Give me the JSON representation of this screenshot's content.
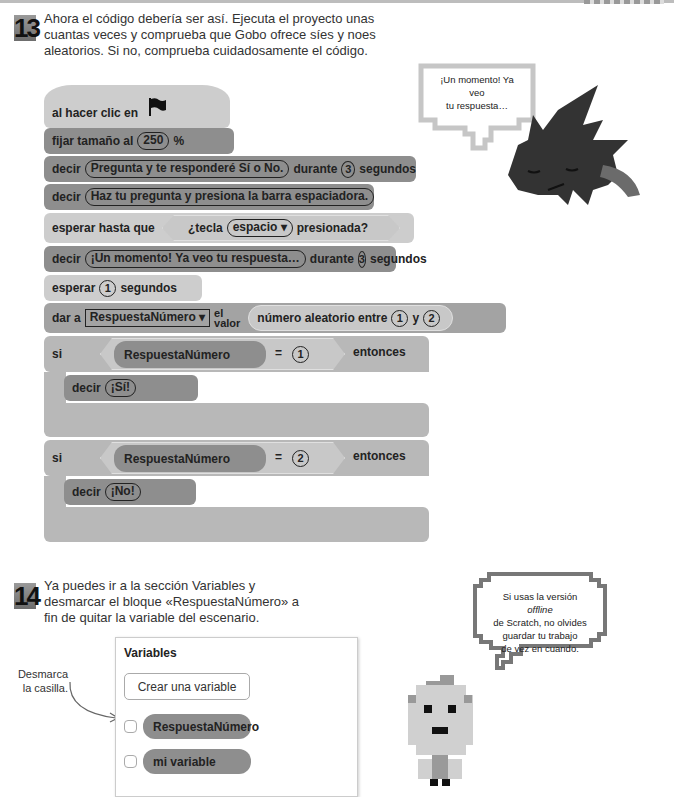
{
  "steps": [
    {
      "number": "13",
      "text": "Ahora el código debería ser así. Ejecuta el proyecto unas cuantas veces y comprueba que Gobo ofrece síes y noes aleatorios. Si no, comprueba cuidadosamente el código."
    },
    {
      "number": "14",
      "text": "Ya puedes ir a la sección Variables y desmarcar el bloque «RespuestaNúmero» a fin de quitar la variable del escenario."
    }
  ],
  "script": {
    "hat": {
      "label": "al hacer clic en",
      "icon": "green-flag-icon"
    },
    "set_size": {
      "label": "fijar tamaño al",
      "value": "250",
      "suffix": "%"
    },
    "say1": {
      "label": "decir",
      "message": "Pregunta y te responderé Sí o No.",
      "during": "durante",
      "secs": "3",
      "unit": "segundos"
    },
    "say2": {
      "label": "decir",
      "message": "Haz tu pregunta y presiona la barra espaciadora."
    },
    "wait_until": {
      "label": "esperar hasta que",
      "cond_pre": "¿tecla",
      "key": "espacio",
      "cond_post": "presionada?"
    },
    "say3": {
      "label": "decir",
      "message": "¡Un momento! Ya veo tu respuesta…",
      "during": "durante",
      "secs": "3",
      "unit": "segundos"
    },
    "wait": {
      "label": "esperar",
      "secs": "1",
      "unit": "segundos"
    },
    "set_var": {
      "label": "dar a",
      "var": "RespuestaNúmero",
      "el": "el",
      "valor": "valor",
      "random": "número aleatorio entre",
      "from": "1",
      "and": "y",
      "to": "2"
    },
    "if1": {
      "label": "si",
      "var": "RespuestaNúmero",
      "eq": "=",
      "value": "1",
      "then": "entonces",
      "say_label": "decir",
      "say": "¡Sí!"
    },
    "if2": {
      "label": "si",
      "var": "RespuestaNúmero",
      "eq": "=",
      "value": "2",
      "then": "entonces",
      "say_label": "decir",
      "say": "¡No!"
    }
  },
  "bubble_gobo": {
    "line1": "¡Un momento! Ya veo",
    "line2": "tu respuesta…"
  },
  "bubble_tip": {
    "line1a": "Si usas la versión ",
    "line1b": "offline",
    "line2": "de Scratch, no olvides",
    "line3": "guardar tu trabajo",
    "line4": "de vez en cuando."
  },
  "variables_panel": {
    "title": "Variables",
    "create_button": "Crear una variable",
    "items": [
      {
        "name": "RespuestaNúmero",
        "checked": false
      },
      {
        "name": "mi variable",
        "checked": false
      }
    ]
  },
  "annotation": {
    "line1": "Desmarca",
    "line2": "la casilla."
  }
}
